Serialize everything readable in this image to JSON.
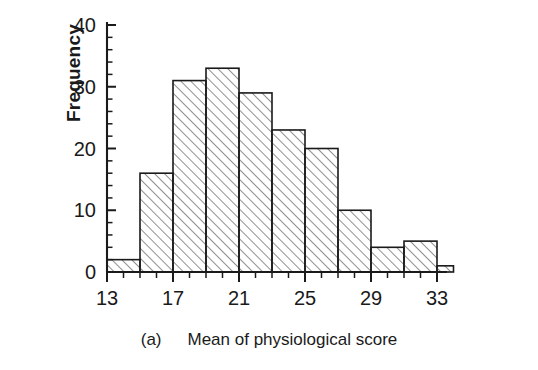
{
  "figure": {
    "caption_tag": "(a)",
    "caption_text": "Mean of physiological score",
    "background_color": "#ffffff",
    "ink_color": "#1a1a1a"
  },
  "axes": {
    "y_title": "Frequency",
    "y_ticks_major": [
      "0",
      "10",
      "20",
      "30",
      "40"
    ],
    "x_ticks_major": [
      "13",
      "17",
      "21",
      "25",
      "29",
      "33"
    ]
  },
  "chart_data": {
    "type": "bar",
    "title": "",
    "subtitle": "",
    "xlabel": "Mean of physiological score",
    "ylabel": "Frequency",
    "xlim": [
      13,
      33
    ],
    "ylim": [
      0,
      41
    ],
    "grid": false,
    "legend": null,
    "bin_width": 2,
    "bin_edges": [
      13,
      15,
      17,
      19,
      21,
      23,
      25,
      27,
      29,
      31,
      33
    ],
    "categories": [
      "13-15",
      "15-17",
      "17-19",
      "19-21",
      "21-23",
      "23-25",
      "25-27",
      "27-29",
      "29-31",
      "31-33"
    ],
    "values": [
      2,
      16,
      31,
      33,
      29,
      23,
      20,
      10,
      4,
      5
    ],
    "tail_bin": {
      "range": "33-34",
      "value": 1
    },
    "x_tick_labels": [
      "13",
      "17",
      "21",
      "25",
      "29",
      "33"
    ],
    "x_tick_values": [
      13,
      17,
      21,
      25,
      29,
      33
    ],
    "x_minor_tick_step": 1,
    "y_tick_labels": [
      "0",
      "10",
      "20",
      "30",
      "40"
    ],
    "y_tick_values": [
      0,
      10,
      20,
      30,
      40
    ],
    "y_minor_tick_step": 2,
    "bar_fill": "hatch-45-forward",
    "bar_edge_color": "#1a1a1a",
    "bar_hatch_color": "#7a7a7a"
  }
}
